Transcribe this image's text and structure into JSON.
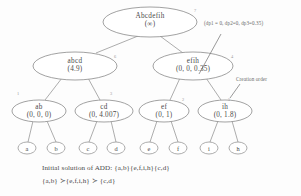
{
  "diagram": {
    "title_caption_line1": "Initial solution of ADD: {a,b}{e,f,i,h}{c,d}",
    "title_caption_line2": "{a,b} ≻{e,f,i,h} ≻ {c,d}",
    "annotations": {
      "dp_values": "(dp1 = 0, dp2=0, dp3=0.35)",
      "creation_order": "Creation order"
    },
    "nodes": [
      {
        "id": "root",
        "name": "Abcdefih",
        "value": "(∞)",
        "order": "7",
        "cx": 150,
        "cy": 22,
        "rx": 47,
        "ry": 15
      },
      {
        "id": "abcd",
        "name": "abcd",
        "value": "(4.9)",
        "order": "6",
        "cx": 75,
        "cy": 66,
        "rx": 42,
        "ry": 14
      },
      {
        "id": "efih",
        "name": "efih",
        "value": "(0, 0, 0.35)",
        "order": "4",
        "cx": 193,
        "cy": 66,
        "rx": 40,
        "ry": 14
      },
      {
        "id": "ab",
        "name": "ab",
        "value": "(0, 0, 0)",
        "order": "1",
        "cx": 39,
        "cy": 111,
        "rx": 27,
        "ry": 11
      },
      {
        "id": "cd",
        "name": "cd",
        "value": "(0, 4.007)",
        "order": "3",
        "cx": 104,
        "cy": 111,
        "rx": 29,
        "ry": 11
      },
      {
        "id": "ef",
        "name": "ef",
        "value": "(0, 1)",
        "order": "2",
        "cx": 164,
        "cy": 111,
        "rx": 25,
        "ry": 11
      },
      {
        "id": "ih",
        "name": "ih",
        "value": "(0, 1.8)",
        "order": "5",
        "cx": 225,
        "cy": 111,
        "rx": 27,
        "ry": 11
      }
    ],
    "leaves": [
      {
        "id": "leaf-a",
        "label": "a",
        "cx": 27,
        "cy": 148,
        "rx": 9,
        "ry": 6
      },
      {
        "id": "leaf-b",
        "label": "b",
        "cx": 56,
        "cy": 148,
        "rx": 9,
        "ry": 6
      },
      {
        "id": "leaf-c",
        "label": "c",
        "cx": 88,
        "cy": 148,
        "rx": 9,
        "ry": 6
      },
      {
        "id": "leaf-d",
        "label": "d",
        "cx": 116,
        "cy": 148,
        "rx": 9,
        "ry": 6
      },
      {
        "id": "leaf-e",
        "label": "e",
        "cx": 149,
        "cy": 148,
        "rx": 9,
        "ry": 6
      },
      {
        "id": "leaf-f",
        "label": "f",
        "cx": 178,
        "cy": 148,
        "rx": 9,
        "ry": 6
      },
      {
        "id": "leaf-i",
        "label": "i",
        "cx": 209,
        "cy": 148,
        "rx": 9,
        "ry": 6
      },
      {
        "id": "leaf-h",
        "label": "h",
        "cx": 238,
        "cy": 148,
        "rx": 9,
        "ry": 6
      }
    ],
    "colors": {
      "stroke": "#8a8a8a",
      "text": "#4a4a4a",
      "background": "#fdfdfd"
    }
  }
}
